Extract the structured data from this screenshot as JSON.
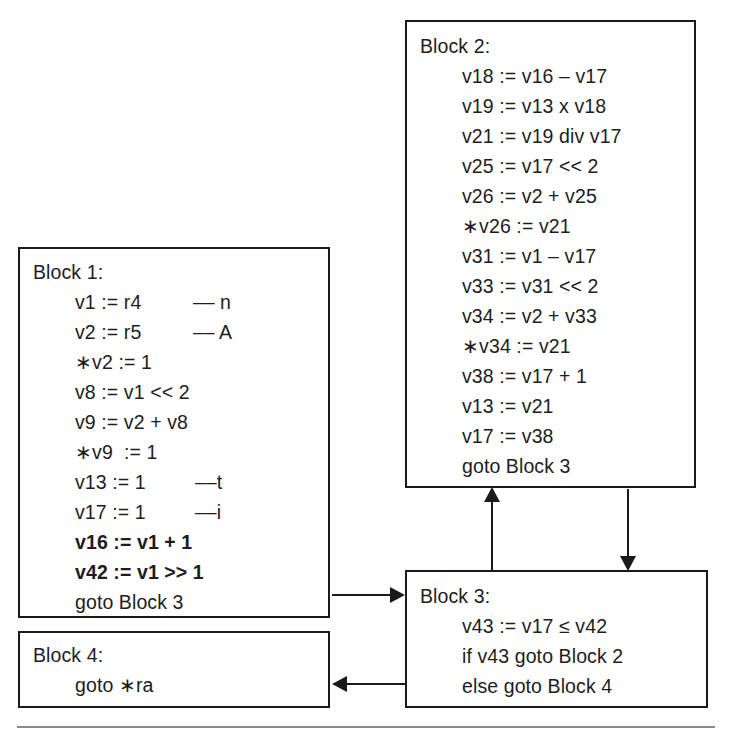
{
  "diagram": {
    "line_color": "#1a1a1a",
    "text_color": "#1d1d1d",
    "background": "#ffffff"
  },
  "blocks": [
    {
      "id": "block1",
      "label": "Block 1:",
      "lines": [
        {
          "code": "v1 := r4",
          "comment": "–– n",
          "bold": false
        },
        {
          "code": "v2 := r5",
          "comment": "–– A",
          "bold": false
        },
        {
          "code": "∗v2 := 1",
          "comment": "",
          "bold": false
        },
        {
          "code": "v8 := v1 << 2",
          "comment": "",
          "bold": false
        },
        {
          "code": "v9 := v2 + v8",
          "comment": "",
          "bold": false
        },
        {
          "code": "∗v9  := 1",
          "comment": "",
          "bold": false
        },
        {
          "code": "v13 := 1",
          "comment": "––t",
          "bold": false
        },
        {
          "code": "v17 := 1",
          "comment": "––i",
          "bold": false
        },
        {
          "code": "v16 := v1 + 1",
          "comment": "",
          "bold": true
        },
        {
          "code": "v42 := v1 >> 1",
          "comment": "",
          "bold": true
        },
        {
          "code": "goto Block 3",
          "comment": "",
          "bold": false
        }
      ]
    },
    {
      "id": "block2",
      "label": "Block 2:",
      "lines": [
        {
          "code": "v18 := v16 – v17",
          "comment": "",
          "bold": false
        },
        {
          "code": "v19 := v13 x v18",
          "comment": "",
          "bold": false
        },
        {
          "code": "v21 := v19 div v17",
          "comment": "",
          "bold": false
        },
        {
          "code": "v25 := v17 << 2",
          "comment": "",
          "bold": false
        },
        {
          "code": "v26 := v2 + v25",
          "comment": "",
          "bold": false
        },
        {
          "code": "∗v26 := v21",
          "comment": "",
          "bold": false
        },
        {
          "code": "v31 := v1 – v17",
          "comment": "",
          "bold": false
        },
        {
          "code": "v33 := v31 << 2",
          "comment": "",
          "bold": false
        },
        {
          "code": "v34 := v2 + v33",
          "comment": "",
          "bold": false
        },
        {
          "code": "∗v34 := v21",
          "comment": "",
          "bold": false
        },
        {
          "code": "v38 := v17 + 1",
          "comment": "",
          "bold": false
        },
        {
          "code": "v13 := v21",
          "comment": "",
          "bold": false
        },
        {
          "code": "v17 := v38",
          "comment": "",
          "bold": false
        },
        {
          "code": "goto Block 3",
          "comment": "",
          "bold": false
        }
      ]
    },
    {
      "id": "block3",
      "label": "Block 3:",
      "lines": [
        {
          "code": "v43 := v17 ≤ v42",
          "comment": "",
          "bold": false
        },
        {
          "code": "if v43 goto Block 2",
          "comment": "",
          "bold": false
        },
        {
          "code": "else goto Block 4",
          "comment": "",
          "bold": false
        }
      ]
    },
    {
      "id": "block4",
      "label": "Block 4:",
      "lines": [
        {
          "code": "goto ∗ra",
          "comment": "",
          "bold": false
        }
      ]
    }
  ],
  "edges": [
    {
      "name": "block1-to-block3",
      "from": "Block 1",
      "to": "Block 3",
      "direction": "right"
    },
    {
      "name": "block3-to-block2",
      "from": "Block 3",
      "to": "Block 2",
      "direction": "up"
    },
    {
      "name": "block2-to-block3",
      "from": "Block 2",
      "to": "Block 3",
      "direction": "down"
    },
    {
      "name": "block3-to-block4",
      "from": "Block 3",
      "to": "Block 4",
      "direction": "left"
    }
  ]
}
